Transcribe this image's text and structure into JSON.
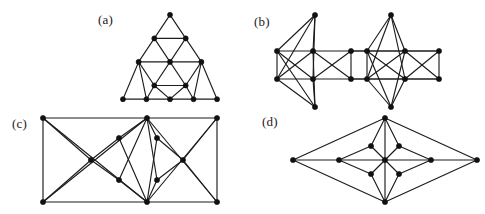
{
  "figure": {
    "background_color": "#ffffff",
    "line_color": "#1c1c1c",
    "node_color": "#111111",
    "width": 485,
    "height": 214,
    "panel_count": 4
  },
  "panels": [
    {
      "id": "a",
      "label": "(a)",
      "label_x": 98,
      "label_y": 12,
      "description": "Sierpinski-like triangular graph of order 2",
      "origin_x": 118,
      "origin_y": 8,
      "view_w": 100,
      "view_h": 96,
      "node_radius": 2.6,
      "nodes": [
        [
          50,
          4
        ],
        [
          34,
          28
        ],
        [
          66,
          28
        ],
        [
          18,
          52
        ],
        [
          50,
          52
        ],
        [
          82,
          52
        ],
        [
          34,
          76
        ],
        [
          66,
          76
        ],
        [
          2,
          90
        ],
        [
          26,
          90
        ],
        [
          50,
          90
        ],
        [
          74,
          90
        ],
        [
          98,
          90
        ]
      ],
      "edges": [
        [
          0,
          1
        ],
        [
          0,
          2
        ],
        [
          1,
          2
        ],
        [
          1,
          3
        ],
        [
          1,
          4
        ],
        [
          2,
          4
        ],
        [
          2,
          5
        ],
        [
          3,
          4
        ],
        [
          4,
          5
        ],
        [
          3,
          6
        ],
        [
          4,
          6
        ],
        [
          4,
          7
        ],
        [
          5,
          7
        ],
        [
          6,
          7
        ],
        [
          3,
          8
        ],
        [
          3,
          9
        ],
        [
          6,
          9
        ],
        [
          6,
          10
        ],
        [
          8,
          9
        ],
        [
          9,
          10
        ],
        [
          10,
          11
        ],
        [
          11,
          12
        ],
        [
          5,
          11
        ],
        [
          5,
          12
        ],
        [
          7,
          10
        ],
        [
          7,
          11
        ]
      ]
    },
    {
      "id": "b",
      "label": "(b)",
      "label_x": 254,
      "label_y": 14,
      "description": "Two joined cube-like graphs sharing middle vertices",
      "origin_x": 272,
      "origin_y": 10,
      "view_w": 166,
      "view_h": 88,
      "node_radius": 2.6,
      "nodes": [
        [
          40,
          2
        ],
        [
          2,
          38
        ],
        [
          38,
          38
        ],
        [
          76,
          38
        ],
        [
          2,
          66
        ],
        [
          38,
          66
        ],
        [
          76,
          66
        ],
        [
          40,
          94
        ],
        [
          116,
          2
        ],
        [
          92,
          38
        ],
        [
          130,
          38
        ],
        [
          164,
          38
        ],
        [
          92,
          66
        ],
        [
          130,
          66
        ],
        [
          164,
          66
        ],
        [
          116,
          94
        ]
      ],
      "edges": [
        [
          0,
          1
        ],
        [
          0,
          2
        ],
        [
          0,
          4
        ],
        [
          0,
          5
        ],
        [
          1,
          2
        ],
        [
          2,
          3
        ],
        [
          1,
          4
        ],
        [
          3,
          6
        ],
        [
          4,
          5
        ],
        [
          5,
          6
        ],
        [
          7,
          4
        ],
        [
          7,
          5
        ],
        [
          7,
          1
        ],
        [
          7,
          2
        ],
        [
          1,
          5
        ],
        [
          2,
          6
        ],
        [
          2,
          4
        ],
        [
          3,
          5
        ],
        [
          8,
          9
        ],
        [
          8,
          10
        ],
        [
          8,
          12
        ],
        [
          8,
          13
        ],
        [
          9,
          10
        ],
        [
          10,
          11
        ],
        [
          9,
          12
        ],
        [
          11,
          14
        ],
        [
          12,
          13
        ],
        [
          13,
          14
        ],
        [
          15,
          12
        ],
        [
          15,
          13
        ],
        [
          15,
          9
        ],
        [
          15,
          10
        ],
        [
          9,
          13
        ],
        [
          10,
          14
        ],
        [
          10,
          12
        ],
        [
          11,
          13
        ],
        [
          3,
          9
        ],
        [
          6,
          12
        ],
        [
          3,
          11
        ],
        [
          6,
          14
        ]
      ]
    },
    {
      "id": "c",
      "label": "(c)",
      "label_x": 12,
      "label_y": 116,
      "description": "Rectangular frame graph with dense inner fan structure",
      "origin_x": 38,
      "origin_y": 113,
      "view_w": 178,
      "view_h": 88,
      "node_radius": 2.6,
      "nodes": [
        [
          2,
          2
        ],
        [
          106,
          2
        ],
        [
          176,
          2
        ],
        [
          2,
          86
        ],
        [
          106,
          86
        ],
        [
          176,
          86
        ],
        [
          50,
          44
        ],
        [
          142,
          44
        ],
        [
          78,
          22
        ],
        [
          78,
          64
        ],
        [
          116,
          22
        ],
        [
          116,
          64
        ]
      ],
      "edges": [
        [
          0,
          1
        ],
        [
          1,
          2
        ],
        [
          0,
          3
        ],
        [
          2,
          5
        ],
        [
          3,
          4
        ],
        [
          4,
          5
        ],
        [
          0,
          6
        ],
        [
          3,
          6
        ],
        [
          6,
          8
        ],
        [
          6,
          9
        ],
        [
          2,
          7
        ],
        [
          5,
          7
        ],
        [
          7,
          10
        ],
        [
          7,
          11
        ],
        [
          1,
          8
        ],
        [
          1,
          9
        ],
        [
          1,
          10
        ],
        [
          1,
          11
        ],
        [
          4,
          8
        ],
        [
          4,
          9
        ],
        [
          4,
          10
        ],
        [
          4,
          11
        ],
        [
          0,
          4
        ],
        [
          3,
          1
        ],
        [
          1,
          5
        ],
        [
          2,
          4
        ]
      ]
    },
    {
      "id": "d",
      "label": "(d)",
      "label_x": 262,
      "label_y": 114,
      "description": "Rhombus graph with central hub and four satellite vertices",
      "origin_x": 288,
      "origin_y": 113,
      "view_w": 188,
      "view_h": 88,
      "node_radius": 2.6,
      "nodes": [
        [
          2,
          44
        ],
        [
          186,
          44
        ],
        [
          94,
          2
        ],
        [
          94,
          86
        ],
        [
          48,
          44
        ],
        [
          140,
          44
        ],
        [
          94,
          44
        ],
        [
          80,
          30
        ],
        [
          108,
          30
        ],
        [
          80,
          58
        ],
        [
          108,
          58
        ]
      ],
      "edges": [
        [
          0,
          2
        ],
        [
          0,
          3
        ],
        [
          1,
          2
        ],
        [
          1,
          3
        ],
        [
          0,
          4
        ],
        [
          4,
          6
        ],
        [
          6,
          5
        ],
        [
          5,
          1
        ],
        [
          2,
          7
        ],
        [
          2,
          8
        ],
        [
          2,
          6
        ],
        [
          3,
          9
        ],
        [
          3,
          10
        ],
        [
          3,
          6
        ],
        [
          4,
          7
        ],
        [
          4,
          9
        ],
        [
          5,
          8
        ],
        [
          5,
          10
        ],
        [
          6,
          7
        ],
        [
          6,
          8
        ],
        [
          6,
          9
        ],
        [
          6,
          10
        ]
      ]
    }
  ]
}
